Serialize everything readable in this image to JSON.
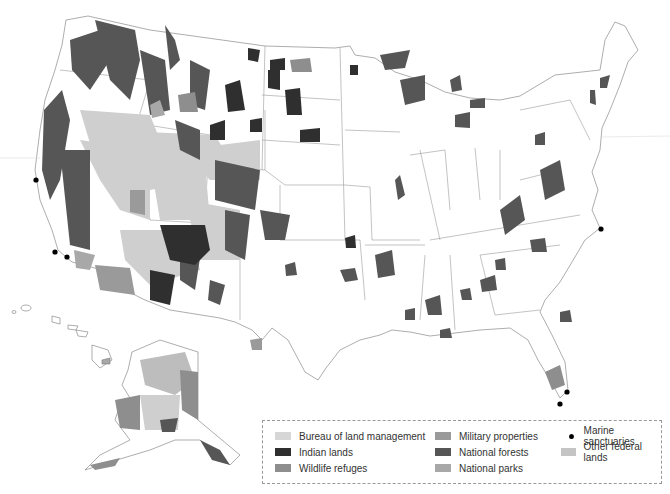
{
  "map": {
    "subject": "Federal lands of the United States",
    "regions_shown": [
      "Contiguous United States",
      "Alaska",
      "Hawaii"
    ]
  },
  "legend": {
    "items": [
      {
        "label": "Bureau of land management",
        "type": "swatch",
        "color": "#cfcfcf"
      },
      {
        "label": "Indian lands",
        "type": "swatch",
        "color": "#2f2f2f"
      },
      {
        "label": "Wildlife refuges",
        "type": "swatch",
        "color": "#8e8e8e"
      },
      {
        "label": "Military properties",
        "type": "swatch",
        "color": "#9a9a9a"
      },
      {
        "label": "National forests",
        "type": "swatch",
        "color": "#565656"
      },
      {
        "label": "National parks",
        "type": "swatch",
        "color": "#a8a8a8"
      },
      {
        "label": "Marine sanctuaries",
        "type": "dot",
        "color": "#000000"
      },
      {
        "label": "Other federal lands",
        "type": "swatch",
        "color": "#bdbdbd"
      }
    ]
  },
  "marine_sanctuary_points": [
    {
      "x": 36,
      "y": 180
    },
    {
      "x": 55,
      "y": 252
    },
    {
      "x": 67,
      "y": 257
    },
    {
      "x": 601,
      "y": 229
    },
    {
      "x": 567,
      "y": 392
    },
    {
      "x": 560,
      "y": 404
    }
  ]
}
